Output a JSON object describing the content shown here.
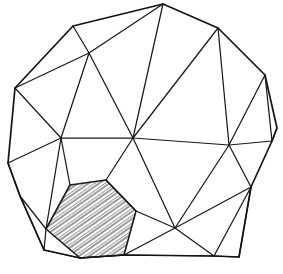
{
  "figure": {
    "kind": "line-drawing",
    "width": 283,
    "height": 274,
    "background_color": "#ffffff",
    "line_color": "#1a1a1a",
    "outline_color": "#141414",
    "hatch_color": "#555555",
    "line_width": 1.25,
    "outline_width": 1.7
  },
  "geometry": {
    "vertices": {
      "apex": [
        163,
        4
      ],
      "tl_ridge": [
        73,
        26
      ],
      "tl_node": [
        89,
        53
      ],
      "tr_node": [
        218,
        28
      ],
      "r_upper": [
        265,
        75
      ],
      "r_sliver_a": [
        277,
        128
      ],
      "r_sliver_b": [
        272,
        141
      ],
      "l_upper": [
        15,
        88
      ],
      "l_mid": [
        8,
        163
      ],
      "c_left": [
        61,
        138
      ],
      "c_center": [
        133,
        138
      ],
      "c_right": [
        229,
        145
      ],
      "r_low": [
        251,
        187
      ],
      "b_center": [
        175,
        228
      ],
      "b_right": [
        214,
        256
      ],
      "b_far_right": [
        239,
        257
      ],
      "hex_a": [
        70,
        185
      ],
      "hex_b": [
        106,
        180
      ],
      "hex_c": [
        136,
        211
      ],
      "hex_d": [
        124,
        255
      ],
      "hex_e": [
        80,
        258
      ],
      "hex_f": [
        46,
        229
      ],
      "bl_corner": [
        44,
        250
      ],
      "l_low": [
        20,
        196
      ]
    },
    "hatched_face": {
      "name": "shaded-hexagon",
      "points": "70,185 106,180 136,211 124,255 80,258 46,229",
      "hatch_angle_deg": 55,
      "hatch_spacing": 2.2
    },
    "outline_path": "M163,4 L218,28 L265,75 L277,128 L272,141 L251,187 L239,257 L214,256 L124,255 L80,258 L44,250 L20,196 L8,163 L15,88 L73,26 Z",
    "edges": [
      "M73,26 L89,53",
      "M163,4 L89,53",
      "M163,4 L133,138",
      "M218,28 L133,138",
      "M218,28 L229,145",
      "M265,75 L229,145",
      "M265,75 L272,141",
      "M277,128 L272,141",
      "M15,88 L89,53",
      "M15,88 L61,138",
      "M89,53 L61,138",
      "M89,53 L133,138",
      "M61,138 L133,138",
      "M133,138 L229,145",
      "M229,145 L272,141",
      "M8,163 L61,138",
      "M8,163 L20,196",
      "M61,138 L70,185",
      "M61,138 L46,229",
      "M20,196 L46,229",
      "M20,196 L44,250",
      "M46,229 L44,250",
      "M133,138 L106,180",
      "M133,138 L175,228",
      "M136,211 L175,228",
      "M124,255 L175,228",
      "M175,228 L229,145",
      "M175,228 L251,187",
      "M175,228 L214,256",
      "M229,145 L251,187",
      "M251,187 L214,256",
      "M251,187 L239,257",
      "M214,256 L239,257",
      "M124,255 L214,256",
      "M80,258 L124,255",
      "M44,250 L80,258",
      "M106,180 L136,211"
    ]
  }
}
